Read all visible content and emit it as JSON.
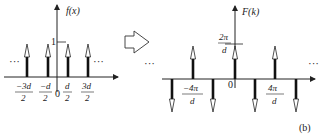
{
  "left_plot": {
    "y_label": "f(x)",
    "height_label": "1",
    "origin_label": "0",
    "ellipsis_left": "···",
    "ellipsis_right": "···",
    "ticks": [
      {
        "num": "−3d",
        "den": "2"
      },
      {
        "num": "−d",
        "den": "2"
      },
      {
        "num": "d",
        "den": "2"
      },
      {
        "num": "3d",
        "den": "2"
      }
    ]
  },
  "transform_arrow": "fourier-transform-arrow",
  "right_plot": {
    "y_label": "F(k)",
    "height_label": {
      "num": "2π",
      "den": "d"
    },
    "origin_label": "0",
    "ellipsis_left": "···",
    "ellipsis_right": "···",
    "ticks": [
      {
        "num": "−4π",
        "den": "d"
      },
      {
        "num": "4π",
        "den": "d"
      }
    ]
  },
  "panel_label": "(b)"
}
